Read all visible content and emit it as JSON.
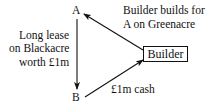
{
  "nodes": {
    "a": "A",
    "b": "B",
    "builder": "Builder"
  },
  "labels": {
    "lease": [
      "Long lease",
      "on Blackacre",
      "worth £1m"
    ],
    "builds": [
      "Builder builds for",
      "A on Greenacre"
    ],
    "cash": "£1m cash"
  },
  "edges": [
    {
      "from": "A",
      "to": "B",
      "label": "Long lease on Blackacre worth £1m"
    },
    {
      "from": "Builder",
      "to": "A",
      "label": "Builder builds for A on Greenacre"
    },
    {
      "from": "B",
      "to": "Builder",
      "label": "£1m cash"
    }
  ]
}
